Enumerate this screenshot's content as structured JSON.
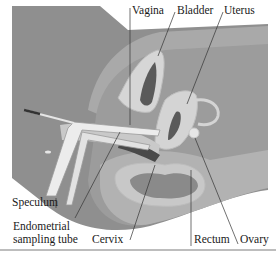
{
  "figure": {
    "type": "anatomical-diagram",
    "labels": {
      "vagina": "Vagina",
      "bladder": "Bladder",
      "uterus": "Uterus",
      "speculum": "Speculum",
      "endometrial_line1": "Endometrial",
      "endometrial_line2": "sampling tube",
      "cervix": "Cervix",
      "rectum": "Rectum",
      "ovary": "Ovary"
    },
    "colors": {
      "body_dark": "#8f8f8f",
      "body_mid": "#a9a9a9",
      "tissue_light": "#c4c4c4",
      "organ_pale": "#d9d9d9",
      "organ_lumen": "#5a5a5a",
      "instrument": "#e8e8e8",
      "leader_line": "#333333"
    }
  }
}
